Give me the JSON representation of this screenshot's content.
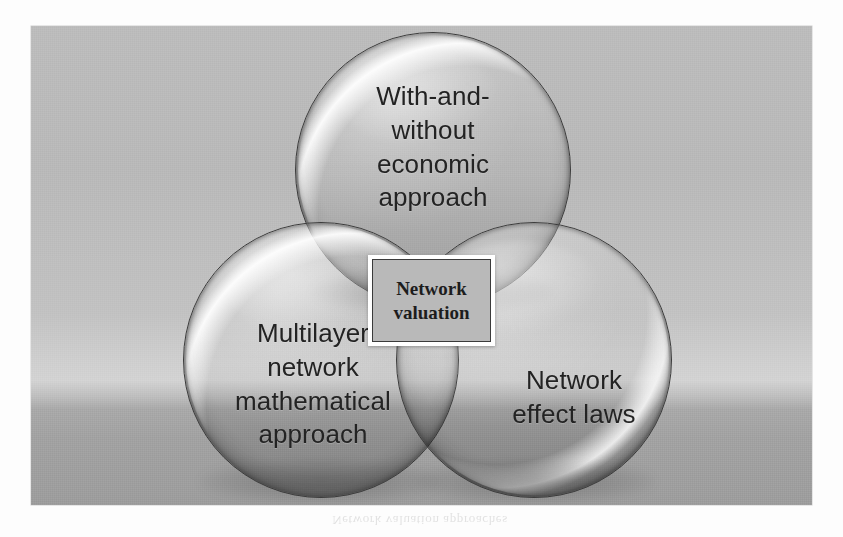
{
  "figure": {
    "kind": "three-circle Venn diagram",
    "background_colors": {
      "plate_top": "#bcbcbc",
      "plate_horizon": "#d3d3d3",
      "plate_bottom": "#9d9d9d",
      "page": "#fdfdfd"
    },
    "circles": [
      {
        "id": "top",
        "position": "top",
        "label": "With-and-\nwithout\neconomic\napproach",
        "fill": "#b4b4b4",
        "outline": "#3b3b3b",
        "highlight": "upper-left"
      },
      {
        "id": "left",
        "position": "bottom-left",
        "label": "Multilayer\nnetwork\nmathematical\napproach",
        "fill": "#ababab",
        "outline": "#3b3b3b",
        "highlight": "upper-left"
      },
      {
        "id": "right",
        "position": "bottom-right",
        "label": "Network\neffect laws",
        "fill": "#a6a6a6",
        "outline": "#3b3b3b",
        "highlight": "lower-right"
      }
    ],
    "center_box": {
      "label": "Network\nvaluation",
      "border_color": "#3a3a3a",
      "outer_border_color": "#ffffff",
      "fill": "#b9b9b9",
      "text_color": "#1d1d1d"
    },
    "ghost_caption": "Network valuation approaches"
  }
}
